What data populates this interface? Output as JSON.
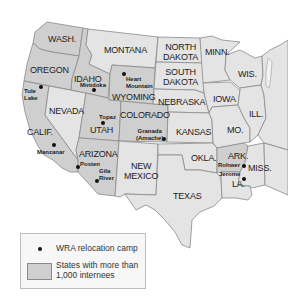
{
  "colors": {
    "shaded_state": "#cfcfcf",
    "unshaded_state": "#e4e4e4",
    "border": "#8a8a8a",
    "camp_dot": "#111111",
    "background": "#ffffff"
  },
  "states": [
    {
      "id": "wash",
      "label": "WASH.",
      "shaded": true
    },
    {
      "id": "oregon",
      "label": "OREGON",
      "shaded": true
    },
    {
      "id": "calif",
      "label": "CALIF.",
      "shaded": true
    },
    {
      "id": "idaho",
      "label": "IDAHO",
      "shaded": true
    },
    {
      "id": "nevada",
      "label": "NEVADA",
      "shaded": false
    },
    {
      "id": "montana",
      "label": "MONTANA",
      "shaded": false
    },
    {
      "id": "wyoming",
      "label": "WYOMING",
      "shaded": true
    },
    {
      "id": "utah",
      "label": "UTAH",
      "shaded": true
    },
    {
      "id": "arizona",
      "label": "ARIZONA",
      "shaded": true
    },
    {
      "id": "colorado",
      "label": "COLORADO",
      "shaded": true
    },
    {
      "id": "new_mexico",
      "label": "NEW MEXICO",
      "shaded": false
    },
    {
      "id": "north_dakota",
      "label": "NORTH DAKOTA",
      "shaded": false
    },
    {
      "id": "south_dakota",
      "label": "SOUTH DAKOTA",
      "shaded": false
    },
    {
      "id": "nebraska",
      "label": "NEBRASKA",
      "shaded": false
    },
    {
      "id": "kansas",
      "label": "KANSAS",
      "shaded": false
    },
    {
      "id": "okla",
      "label": "OKLA.",
      "shaded": false
    },
    {
      "id": "texas",
      "label": "TEXAS",
      "shaded": false
    },
    {
      "id": "minn",
      "label": "MINN.",
      "shaded": false
    },
    {
      "id": "iowa",
      "label": "IOWA",
      "shaded": false
    },
    {
      "id": "mo",
      "label": "MO.",
      "shaded": false
    },
    {
      "id": "ark",
      "label": "ARK.",
      "shaded": true
    },
    {
      "id": "la",
      "label": "LA.",
      "shaded": false
    },
    {
      "id": "wis",
      "label": "WIS.",
      "shaded": false
    },
    {
      "id": "ill",
      "label": "ILL.",
      "shaded": false
    },
    {
      "id": "miss",
      "label": "MISS.",
      "shaded": false
    }
  ],
  "camps": [
    {
      "name": "Tule Lake",
      "line1": "Tule",
      "line2": "Lake"
    },
    {
      "name": "Minidoka",
      "line1": "Minidoka"
    },
    {
      "name": "Heart Mountain",
      "line1": "Heart",
      "line2": "Mountain"
    },
    {
      "name": "Topaz",
      "line1": "Topaz"
    },
    {
      "name": "Manzanar",
      "line1": "Manzanar"
    },
    {
      "name": "Granada (Amache)",
      "line1": "Granada",
      "line2": "(Amache)"
    },
    {
      "name": "Posten",
      "line1": "Posten"
    },
    {
      "name": "Gila River",
      "line1": "Gila",
      "line2": "River"
    },
    {
      "name": "Rohwer",
      "line1": "Rohwer"
    },
    {
      "name": "Jerome",
      "line1": "Jerome"
    }
  ],
  "legend": {
    "camp_label": "WRA relocation camp",
    "shaded_label": "States with more than 1,000 internees"
  }
}
